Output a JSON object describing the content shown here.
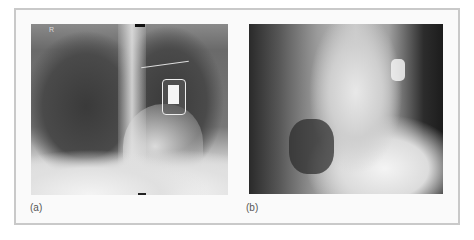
{
  "figure": {
    "panels": [
      {
        "label": "(a)",
        "description": "Posteroanterior chest radiograph showing implanted cardiac device in left upper chest"
      },
      {
        "label": "(b)",
        "description": "Lateral chest radiograph"
      }
    ],
    "markers": {
      "side_marker": "R"
    }
  }
}
